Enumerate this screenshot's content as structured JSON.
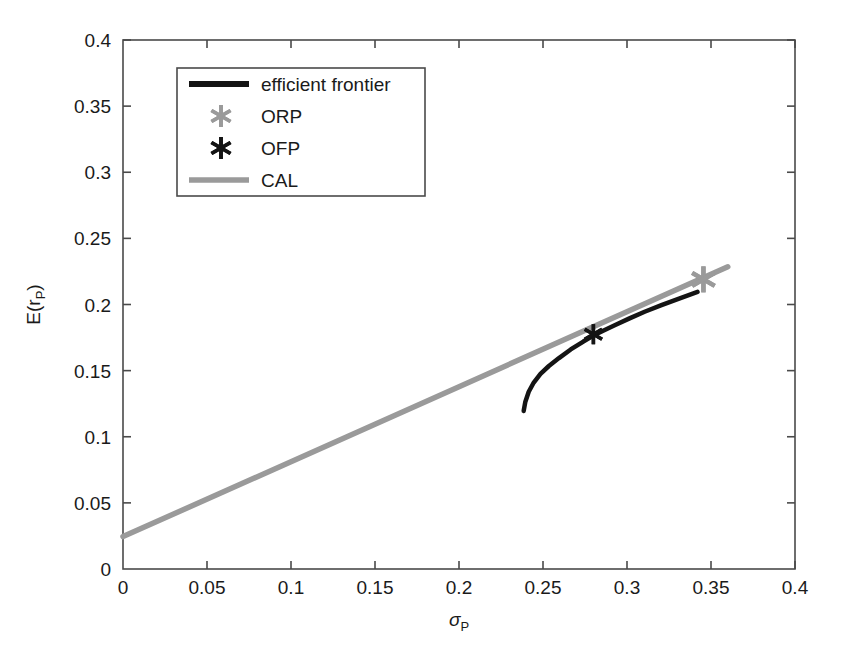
{
  "chart_data": {
    "type": "line",
    "title": "",
    "xlabel": "σ",
    "xlabel_sub": "P",
    "ylabel": "E(r",
    "ylabel_sub": "P",
    "ylabel_close": ")",
    "xlim": [
      0,
      0.4
    ],
    "ylim": [
      0,
      0.4
    ],
    "xticks": [
      "0",
      "0.05",
      "0.1",
      "0.15",
      "0.2",
      "0.25",
      "0.3",
      "0.35",
      "0.4"
    ],
    "xtick_values": [
      0,
      0.05,
      0.1,
      0.15,
      0.2,
      0.25,
      0.3,
      0.35,
      0.4
    ],
    "yticks": [
      "0",
      "0.05",
      "0.1",
      "0.15",
      "0.2",
      "0.25",
      "0.3",
      "0.35",
      "0.4"
    ],
    "ytick_values": [
      0,
      0.05,
      0.1,
      0.15,
      0.2,
      0.25,
      0.3,
      0.35,
      0.4
    ],
    "grid": false,
    "legend_position": "upper-left",
    "legend_entries": [
      {
        "label": "efficient frontier",
        "type": "line",
        "color": "#141414"
      },
      {
        "label": "ORP",
        "type": "marker",
        "color": "#9a9a9a"
      },
      {
        "label": "OFP",
        "type": "marker",
        "color": "#141414"
      },
      {
        "label": "CAL",
        "type": "line",
        "color": "#9a9a9a"
      }
    ],
    "series": [
      {
        "name": "efficient frontier",
        "type": "line",
        "color": "#141414",
        "x": [
          0.2385,
          0.2395,
          0.2415,
          0.2445,
          0.2485,
          0.2535,
          0.2595,
          0.2665,
          0.274,
          0.28,
          0.2855,
          0.293,
          0.3015,
          0.3105,
          0.3205,
          0.331,
          0.342
        ],
        "y": [
          0.1195,
          0.1265,
          0.134,
          0.141,
          0.1475,
          0.1535,
          0.1595,
          0.166,
          0.172,
          0.1765,
          0.18,
          0.1845,
          0.1895,
          0.1945,
          0.1995,
          0.2045,
          0.2095
        ]
      },
      {
        "name": "CAL",
        "type": "line",
        "color": "#9a9a9a",
        "x": [
          0.0,
          0.36
        ],
        "y": [
          0.0245,
          0.2285
        ]
      }
    ],
    "points": [
      {
        "name": "ORP",
        "x": 0.3455,
        "y": 0.219,
        "color": "#9a9a9a",
        "marker": "asterisk",
        "size": 26
      },
      {
        "name": "OFP",
        "x": 0.28,
        "y": 0.1775,
        "color": "#141414",
        "marker": "asterisk",
        "size": 20
      }
    ],
    "annotations": []
  },
  "axes": {
    "plot_left_px": 123,
    "plot_right_px": 795,
    "plot_top_px": 40,
    "plot_bottom_px": 569
  },
  "legend": {
    "box_left_px": 177,
    "box_top_px": 68,
    "box_width_px": 248,
    "box_height_px": 128
  }
}
